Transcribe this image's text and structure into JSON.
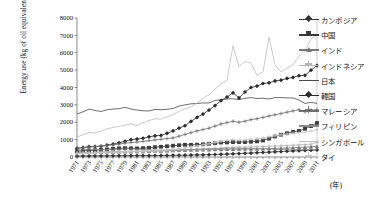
{
  "chart_data": {
    "type": "line",
    "title": "",
    "xlabel": "(年)",
    "ylabel": "Energy use (kg of oil equivalent per capita)",
    "ylim": [
      0,
      8000
    ],
    "ytick_values": [
      0,
      1000,
      2000,
      3000,
      4000,
      5000,
      6000,
      7000,
      8000
    ],
    "ytick_labels": [
      "0",
      "1000",
      "2000",
      "3000",
      "4000",
      "5000",
      "6000",
      "7000",
      "8000"
    ],
    "xlim": [
      1971,
      2011
    ],
    "x": [
      1971,
      1972,
      1973,
      1974,
      1975,
      1976,
      1977,
      1978,
      1979,
      1980,
      1981,
      1982,
      1983,
      1984,
      1985,
      1986,
      1987,
      1988,
      1989,
      1990,
      1991,
      1992,
      1993,
      1994,
      1995,
      1996,
      1997,
      1998,
      1999,
      2000,
      2001,
      2002,
      2003,
      2004,
      2005,
      2006,
      2007,
      2008,
      2009,
      2010,
      2011
    ],
    "xtick_labels": [
      "1971",
      "1973",
      "1975",
      "1977",
      "1979",
      "1981",
      "1983",
      "1985",
      "1987",
      "1989",
      "1991",
      "1993",
      "1995",
      "1997",
      "1999",
      "2001",
      "2003",
      "2005",
      "2007",
      "2009",
      "2011"
    ],
    "grid": false,
    "legend_position": "right",
    "series": [
      {
        "name": "カンボジア",
        "marker": "diamond",
        "color": "#333333",
        "values": [
          60,
          62,
          64,
          66,
          68,
          70,
          72,
          74,
          76,
          78,
          80,
          82,
          84,
          86,
          88,
          90,
          95,
          100,
          105,
          110,
          118,
          126,
          135,
          145,
          155,
          168,
          180,
          195,
          210,
          228,
          245,
          262,
          280,
          298,
          315,
          332,
          348,
          362,
          375,
          390,
          405
        ]
      },
      {
        "name": "中国",
        "marker": "square",
        "color": "#3a3a3a",
        "values": [
          340,
          358,
          378,
          386,
          420,
          438,
          470,
          500,
          508,
          500,
          492,
          508,
          530,
          565,
          590,
          620,
          650,
          680,
          700,
          700,
          710,
          730,
          760,
          790,
          830,
          840,
          860,
          860,
          860,
          880,
          900,
          950,
          1060,
          1180,
          1280,
          1370,
          1450,
          1500,
          1620,
          1780,
          1960
        ]
      },
      {
        "name": "インド",
        "marker": "triangle",
        "color": "#777777",
        "values": [
          268,
          270,
          272,
          276,
          280,
          288,
          295,
          300,
          308,
          310,
          318,
          325,
          335,
          345,
          355,
          365,
          375,
          385,
          395,
          405,
          412,
          420,
          425,
          430,
          440,
          448,
          455,
          458,
          462,
          468,
          470,
          478,
          485,
          495,
          505,
          520,
          535,
          548,
          568,
          590,
          614
        ]
      },
      {
        "name": "インドネシア",
        "marker": "plus",
        "color": "#b5b5b5",
        "values": [
          210,
          215,
          222,
          230,
          240,
          252,
          262,
          275,
          290,
          300,
          312,
          325,
          340,
          355,
          368,
          380,
          395,
          410,
          425,
          440,
          455,
          470,
          485,
          500,
          520,
          540,
          560,
          565,
          570,
          580,
          590,
          600,
          615,
          630,
          645,
          660,
          678,
          695,
          715,
          740,
          857
        ]
      },
      {
        "name": "日本",
        "marker": "dash",
        "color": "#4a4a4a",
        "values": [
          2480,
          2600,
          2760,
          2680,
          2620,
          2720,
          2760,
          2780,
          2860,
          2760,
          2700,
          2660,
          2650,
          2740,
          2720,
          2740,
          2790,
          2930,
          3000,
          3060,
          3080,
          3110,
          3110,
          3250,
          3300,
          3340,
          3350,
          3300,
          3380,
          3420,
          3370,
          3380,
          3340,
          3420,
          3420,
          3400,
          3400,
          3280,
          3080,
          3150,
          3080
        ]
      },
      {
        "name": "韓国",
        "marker": "diamond",
        "color": "#2b2b2b",
        "values": [
          500,
          540,
          600,
          600,
          620,
          680,
          740,
          820,
          900,
          1000,
          1030,
          1080,
          1160,
          1220,
          1240,
          1360,
          1500,
          1660,
          1800,
          2050,
          2280,
          2470,
          2700,
          2960,
          3240,
          3450,
          3690,
          3400,
          3740,
          4000,
          4080,
          4230,
          4270,
          4380,
          4420,
          4520,
          4580,
          4680,
          4700,
          5000,
          5260
        ]
      },
      {
        "name": "マレーシア",
        "marker": "plus",
        "color": "#6f6f6f",
        "values": [
          520,
          540,
          570,
          600,
          620,
          660,
          700,
          740,
          800,
          830,
          860,
          900,
          940,
          980,
          1020,
          1060,
          1100,
          1200,
          1300,
          1400,
          1500,
          1580,
          1660,
          1780,
          1900,
          1980,
          2060,
          2000,
          2060,
          2150,
          2200,
          2280,
          2360,
          2430,
          2500,
          2580,
          2650,
          2720,
          2600,
          2700,
          2730
        ]
      },
      {
        "name": "フィリピン",
        "marker": "none",
        "color": "#8a8a8a",
        "values": [
          400,
          420,
          440,
          430,
          420,
          430,
          440,
          450,
          470,
          460,
          450,
          440,
          430,
          400,
          390,
          380,
          390,
          400,
          420,
          430,
          440,
          450,
          460,
          470,
          480,
          500,
          510,
          500,
          490,
          495,
          480,
          470,
          460,
          450,
          445,
          440,
          435,
          430,
          425,
          430,
          425
        ]
      },
      {
        "name": "シンガポール",
        "marker": "none",
        "color": "#bdbdbd",
        "values": [
          1150,
          1280,
          1420,
          1380,
          1500,
          1620,
          1700,
          1760,
          1840,
          1900,
          1800,
          1980,
          2100,
          2200,
          2180,
          2300,
          2450,
          2620,
          2780,
          2900,
          3100,
          3380,
          3600,
          3900,
          4200,
          4400,
          6400,
          5200,
          5500,
          5400,
          4700,
          4900,
          6900,
          5300,
          4900,
          5100,
          5300,
          5800,
          6100,
          6800,
          7000
        ]
      },
      {
        "name": "タイ",
        "marker": "plus",
        "color": "#c7c7c7",
        "values": [
          200,
          215,
          235,
          245,
          255,
          270,
          285,
          300,
          320,
          325,
          330,
          340,
          360,
          375,
          390,
          410,
          440,
          480,
          530,
          580,
          640,
          700,
          760,
          830,
          900,
          960,
          1000,
          960,
          980,
          1020,
          1060,
          1100,
          1160,
          1220,
          1270,
          1320,
          1370,
          1400,
          1430,
          1500,
          1570
        ]
      }
    ]
  },
  "legend": {
    "items": [
      {
        "label": "カンボジア"
      },
      {
        "label": "中国"
      },
      {
        "label": "インド"
      },
      {
        "label": "インドネシア"
      },
      {
        "label": "日本"
      },
      {
        "label": "韓国"
      },
      {
        "label": "マレーシア"
      },
      {
        "label": "フィリピン"
      },
      {
        "label": "シンガポール"
      },
      {
        "label": "タイ"
      }
    ]
  }
}
